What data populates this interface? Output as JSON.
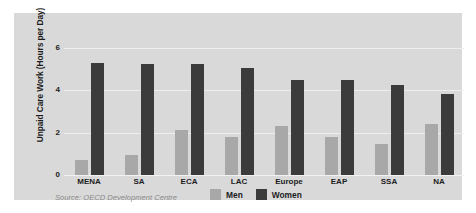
{
  "chart_data": {
    "type": "bar",
    "title": "",
    "xlabel": "",
    "ylabel": "Unpaid Care Work (Hours per Day)",
    "ylim": [
      0,
      6.6
    ],
    "yticks": [
      0,
      2,
      4,
      6
    ],
    "ytick_labels": [
      "0",
      "2",
      "4",
      "6"
    ],
    "grid": true,
    "legend_position": "bottom",
    "categories": [
      "MENA",
      "SA",
      "ECA",
      "LAC",
      "Europe",
      "EAP",
      "SSA",
      "NA"
    ],
    "series": [
      {
        "name": "Men",
        "color": "#a8a8a8",
        "values": [
          0.7,
          0.95,
          2.1,
          1.8,
          2.3,
          1.8,
          1.45,
          2.4
        ]
      },
      {
        "name": "Women",
        "color": "#3b3b3b",
        "values": [
          5.3,
          5.25,
          5.25,
          5.05,
          4.5,
          4.5,
          4.25,
          3.8
        ]
      }
    ],
    "source_note": "Source: OECD Development Centre"
  },
  "colors": {
    "panel_background": "#d9d9d9",
    "page_background": "#ffffff",
    "gridline": "#eeeeee",
    "text": "#1c1c1c",
    "source_text": "#8a8a8a"
  }
}
